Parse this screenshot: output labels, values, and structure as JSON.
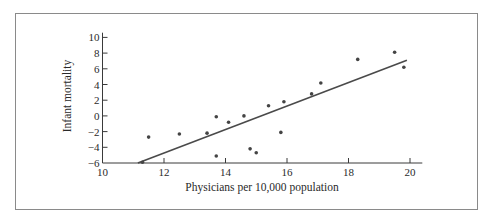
{
  "chart_data": {
    "type": "scatter",
    "title": "",
    "xlabel": "Physicians per 10,000 population",
    "ylabel": "Infant mortality",
    "xlim": [
      10,
      20.4
    ],
    "ylim": [
      -6,
      10.5
    ],
    "x_ticks": [
      10,
      12,
      14,
      16,
      18,
      20
    ],
    "y_ticks": [
      -6,
      -4,
      -2,
      0,
      2,
      4,
      6,
      8,
      10
    ],
    "x_tick_labels": [
      "10",
      "12",
      "14",
      "16",
      "18",
      "20"
    ],
    "y_tick_labels": [
      "−6",
      "−4",
      "−2",
      "0",
      "2",
      "4",
      "6",
      "8",
      "10"
    ],
    "grid": false,
    "legend": null,
    "series": [
      {
        "name": "observations",
        "points": [
          {
            "x": 11.3,
            "y": -5.9
          },
          {
            "x": 11.5,
            "y": -2.7
          },
          {
            "x": 12.5,
            "y": -2.3
          },
          {
            "x": 13.4,
            "y": -2.2
          },
          {
            "x": 13.7,
            "y": -5.1
          },
          {
            "x": 13.7,
            "y": -0.1
          },
          {
            "x": 14.1,
            "y": -0.8
          },
          {
            "x": 14.6,
            "y": 0.0
          },
          {
            "x": 14.8,
            "y": -4.2
          },
          {
            "x": 15.0,
            "y": -4.7
          },
          {
            "x": 15.4,
            "y": 1.3
          },
          {
            "x": 15.8,
            "y": -2.1
          },
          {
            "x": 15.9,
            "y": 1.8
          },
          {
            "x": 16.8,
            "y": 2.8
          },
          {
            "x": 17.1,
            "y": 4.2
          },
          {
            "x": 18.3,
            "y": 7.2
          },
          {
            "x": 19.5,
            "y": 8.1
          },
          {
            "x": 19.8,
            "y": 6.2
          }
        ]
      },
      {
        "name": "fitted line",
        "type": "line",
        "points": [
          {
            "x": 11.15,
            "y": -6.0
          },
          {
            "x": 19.9,
            "y": 7.1
          }
        ]
      }
    ]
  },
  "colors": {
    "ink": "#3a3a3a",
    "frame": "#8a8a8a",
    "background": "#ffffff"
  }
}
